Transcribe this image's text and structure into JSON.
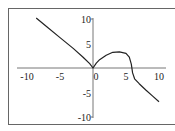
{
  "chart_data": {
    "type": "line",
    "title": "",
    "xlabel": "",
    "ylabel": "",
    "xlim": [
      -10,
      10
    ],
    "ylim": [
      -10,
      10
    ],
    "x_ticks": [
      -10,
      -5,
      0,
      5,
      10
    ],
    "x_tick_labels": [
      "-10",
      "-5",
      "0",
      "5",
      "10"
    ],
    "y_ticks": [
      10,
      5,
      -5,
      -10
    ],
    "y_tick_labels": [
      "10",
      "5",
      "-5",
      "-10"
    ],
    "grid": false,
    "legend": null,
    "axes_style": "cross at origin",
    "series": [
      {
        "name": "curve",
        "color": "#222222",
        "points": [
          [
            -8.6,
            10.2
          ],
          [
            -7,
            8.4
          ],
          [
            -5,
            6.2
          ],
          [
            -3,
            4.0
          ],
          [
            -1.5,
            2.2
          ],
          [
            -0.5,
            0.9
          ],
          [
            0,
            0
          ],
          [
            0.5,
            1.0
          ],
          [
            1,
            1.7
          ],
          [
            2,
            2.6
          ],
          [
            3,
            3.2
          ],
          [
            4,
            3.3
          ],
          [
            5,
            3.0
          ],
          [
            5.5,
            2.2
          ],
          [
            5.8,
            0.8
          ],
          [
            6.0,
            -1.0
          ],
          [
            6.3,
            -2.2
          ],
          [
            7,
            -3.2
          ],
          [
            8,
            -4.5
          ],
          [
            9,
            -5.7
          ],
          [
            10,
            -6.9
          ]
        ]
      }
    ]
  },
  "caption": {
    "clipped_text": ""
  }
}
